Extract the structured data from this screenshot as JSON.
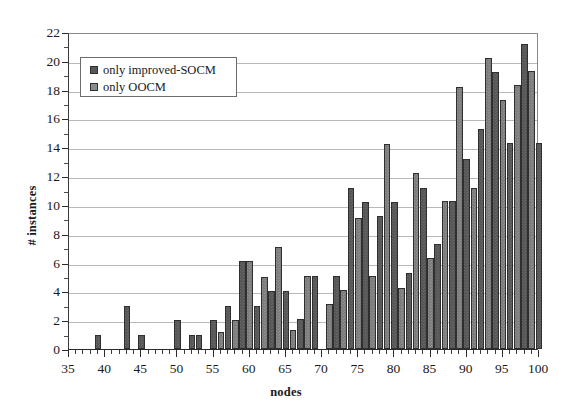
{
  "chart_data": {
    "type": "bar",
    "title": "",
    "xlabel": "nodes",
    "ylabel": "# instances",
    "xlim": [
      35,
      100
    ],
    "ylim": [
      0,
      22
    ],
    "y_ticks": [
      0,
      2,
      4,
      6,
      8,
      10,
      12,
      14,
      16,
      18,
      20,
      22
    ],
    "x_ticks": [
      35,
      40,
      45,
      50,
      55,
      60,
      65,
      70,
      75,
      80,
      85,
      90,
      95,
      100
    ],
    "x_tick_step": 1,
    "grid": "horizontal",
    "legend_position": "upper-left-inside",
    "series": [
      {
        "name": "only improved-SOCM",
        "color": "#575757",
        "values": [
          0,
          0,
          0,
          0,
          1,
          0,
          0,
          0,
          3,
          0,
          1,
          0,
          0,
          0,
          0,
          2,
          0,
          1,
          1,
          0,
          2,
          3,
          6,
          6,
          3,
          5,
          4,
          7,
          2,
          0,
          5,
          5,
          0,
          3,
          4,
          11.2,
          9.1,
          10.2,
          5.1,
          9.2,
          14.2,
          10.2,
          4.2,
          5.3,
          12.2,
          11.2,
          6.3,
          7.3,
          10.3,
          18.2,
          13.2,
          11.2,
          15.3,
          20.2,
          19.2,
          17.3,
          14.3,
          18.3,
          21.2,
          19.3,
          14.3
        ]
      },
      {
        "name": "only OOCM",
        "color": "#8c8c8c",
        "values": [
          0,
          0,
          0,
          0,
          1,
          0,
          0,
          0,
          3,
          0,
          1,
          0,
          0,
          0,
          0,
          2,
          0,
          1,
          1,
          0,
          2,
          3,
          6,
          6,
          3,
          5,
          4,
          7,
          2,
          0,
          5,
          5,
          0,
          3,
          4,
          11.2,
          9.1,
          10.2,
          5.1,
          9.2,
          14.2,
          10.2,
          4.2,
          5.3,
          12.2,
          11.2,
          6.3,
          7.3,
          10.3,
          18.2,
          13.2,
          11.2,
          15.3,
          20.2,
          19.2,
          17.3,
          14.3,
          18.3,
          21.2,
          19.3,
          14.3
        ]
      }
    ],
    "bars": [
      {
        "node": 39,
        "series": 0,
        "value": 1
      },
      {
        "node": 43,
        "series": 0,
        "value": 3
      },
      {
        "node": 45,
        "series": 0,
        "value": 1
      },
      {
        "node": 50,
        "series": 0,
        "value": 2
      },
      {
        "node": 52,
        "series": 0,
        "value": 1
      },
      {
        "node": 53,
        "series": 0,
        "value": 1
      },
      {
        "node": 55,
        "series": 0,
        "value": 2
      },
      {
        "node": 56,
        "series": 1,
        "value": 1.2
      },
      {
        "node": 57,
        "series": 0,
        "value": 3
      },
      {
        "node": 58,
        "series": 1,
        "value": 2
      },
      {
        "node": 59,
        "series": 0,
        "value": 6.1
      },
      {
        "node": 60,
        "series": 1,
        "value": 6.1
      },
      {
        "node": 61,
        "series": 0,
        "value": 3
      },
      {
        "node": 62,
        "series": 1,
        "value": 5
      },
      {
        "node": 63,
        "series": 0,
        "value": 4
      },
      {
        "node": 64,
        "series": 1,
        "value": 7.1
      },
      {
        "node": 65,
        "series": 0,
        "value": 4
      },
      {
        "node": 66,
        "series": 1,
        "value": 1.3
      },
      {
        "node": 67,
        "series": 0,
        "value": 2.1
      },
      {
        "node": 68,
        "series": 1,
        "value": 5.1
      },
      {
        "node": 69,
        "series": 0,
        "value": 5.1
      },
      {
        "node": 71,
        "series": 1,
        "value": 3.1
      },
      {
        "node": 72,
        "series": 0,
        "value": 5.1
      },
      {
        "node": 73,
        "series": 1,
        "value": 4.1
      },
      {
        "node": 74,
        "series": 0,
        "value": 11.2
      },
      {
        "node": 75,
        "series": 1,
        "value": 9.1
      },
      {
        "node": 76,
        "series": 0,
        "value": 10.2
      },
      {
        "node": 77,
        "series": 1,
        "value": 5.1
      },
      {
        "node": 78,
        "series": 0,
        "value": 9.2
      },
      {
        "node": 79,
        "series": 1,
        "value": 14.2
      },
      {
        "node": 80,
        "series": 0,
        "value": 10.2
      },
      {
        "node": 81,
        "series": 1,
        "value": 4.2
      },
      {
        "node": 82,
        "series": 0,
        "value": 5.3
      },
      {
        "node": 83,
        "series": 1,
        "value": 12.2
      },
      {
        "node": 84,
        "series": 0,
        "value": 11.2
      },
      {
        "node": 85,
        "series": 1,
        "value": 6.3
      },
      {
        "node": 86,
        "series": 0,
        "value": 7.3
      },
      {
        "node": 87,
        "series": 1,
        "value": 10.3
      },
      {
        "node": 88,
        "series": 0,
        "value": 10.3
      },
      {
        "node": 89,
        "series": 1,
        "value": 18.2
      },
      {
        "node": 90,
        "series": 0,
        "value": 13.2
      },
      {
        "node": 91,
        "series": 1,
        "value": 11.2
      },
      {
        "node": 92,
        "series": 0,
        "value": 15.3
      },
      {
        "node": 93,
        "series": 1,
        "value": 20.2
      },
      {
        "node": 94,
        "series": 0,
        "value": 19.2
      },
      {
        "node": 95,
        "series": 1,
        "value": 17.3
      },
      {
        "node": 96,
        "series": 0,
        "value": 14.3
      },
      {
        "node": 97,
        "series": 1,
        "value": 18.3
      },
      {
        "node": 98,
        "series": 0,
        "value": 21.2
      },
      {
        "node": 99,
        "series": 1,
        "value": 19.3
      },
      {
        "node": 100,
        "series": 0,
        "value": 14.3
      }
    ]
  },
  "legend": {
    "entries": [
      {
        "label": "only improved-SOCM",
        "swatch": "series-0"
      },
      {
        "label": "only OOCM",
        "swatch": "series-1"
      }
    ]
  },
  "colors": {
    "series_0": "#575757",
    "series_1": "#8c8c8c",
    "axis": "#2b2b2b",
    "grid": "#b9b9b9",
    "background": "#ffffff"
  }
}
